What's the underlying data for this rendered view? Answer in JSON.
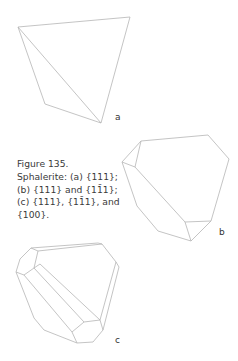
{
  "figure": {
    "number_label": "Figure 135.",
    "caption_lines": [
      "Sphalerite: (a) {111};",
      "(b) {111} and {11̄1};",
      "(c) {111}, {11̄1}, and",
      "{100}."
    ],
    "panels": [
      {
        "label": "a",
        "description": "tetrahedron {111}"
      },
      {
        "label": "b",
        "description": "{111} and {1-11} combination"
      },
      {
        "label": "c",
        "description": "{111}, {1-11}, and {100} combination"
      }
    ],
    "colors": {
      "line": "#b5b5b5",
      "text": "#333333"
    }
  }
}
